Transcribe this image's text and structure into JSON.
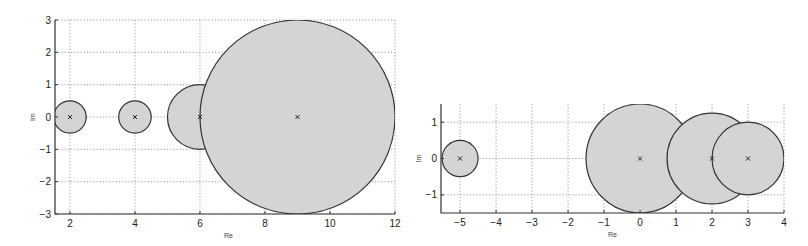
{
  "chart_data": [
    {
      "type": "scatter",
      "title": "",
      "xlabel": "Re",
      "ylabel": "Im",
      "xlim": [
        1.54,
        12
      ],
      "ylim": [
        -3,
        3
      ],
      "xticks": [
        2,
        4,
        6,
        8,
        10,
        12
      ],
      "yticks": [
        -3,
        -2,
        -1,
        0,
        1,
        2,
        3
      ],
      "grid": true,
      "points": [
        {
          "re": 2,
          "im": 0,
          "radius": 0.5
        },
        {
          "re": 4,
          "im": 0,
          "radius": 0.5
        },
        {
          "re": 6,
          "im": 0,
          "radius": 1
        },
        {
          "re": 9,
          "im": 0,
          "radius": 3
        }
      ],
      "fill_color": "#d4d4d4",
      "edge_color": "#333333"
    },
    {
      "type": "scatter",
      "title": "",
      "xlabel": "Re",
      "ylabel": "Im",
      "xlim": [
        -5.53,
        4
      ],
      "ylim": [
        -1.5,
        1.5
      ],
      "xticks": [
        -5,
        -4,
        -3,
        -2,
        -1,
        0,
        1,
        2,
        3,
        4
      ],
      "yticks": [
        -1,
        0,
        1
      ],
      "grid": true,
      "points": [
        {
          "re": -5,
          "im": 0,
          "radius": 0.5
        },
        {
          "re": 0,
          "im": 0,
          "radius": 1.5
        },
        {
          "re": 2,
          "im": 0,
          "radius": 1.25
        },
        {
          "re": 3,
          "im": 0,
          "radius": 1
        }
      ],
      "fill_color": "#d4d4d4",
      "edge_color": "#333333"
    }
  ],
  "plots": [
    {
      "box": {
        "x0": 55,
        "y0": 20,
        "x1": 395,
        "y1": 214
      }
    },
    {
      "box": {
        "x0": 441,
        "y0": 104,
        "x1": 784,
        "y1": 213
      }
    }
  ]
}
